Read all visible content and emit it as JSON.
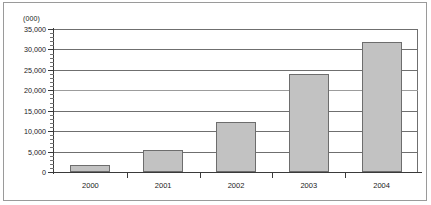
{
  "chart_data": {
    "type": "bar",
    "title": "",
    "subtitle": "",
    "unit_label": "(000)",
    "xlabel": "",
    "ylabel": "",
    "categories": [
      "2000",
      "2001",
      "2002",
      "2003",
      "2004"
    ],
    "values": [
      1700,
      5300,
      12300,
      24100,
      31800
    ],
    "series": [
      {
        "name": "",
        "values": [
          1700,
          5300,
          12300,
          24100,
          31800
        ]
      }
    ],
    "ylim": [
      0,
      35000
    ],
    "ytick_labels": [
      "0",
      "5,000",
      "10,000",
      "15,000",
      "20,000",
      "25,000",
      "30,000",
      "35,000"
    ],
    "ytick_values": [
      0,
      5000,
      10000,
      15000,
      20000,
      25000,
      30000,
      35000
    ],
    "minor_tick_interval": 1000,
    "grid": true,
    "grid_axis": "y",
    "legend": false,
    "legend_position": "none",
    "bar_color": "#c2c2c2",
    "bar_border_color": "#6d6d6d",
    "gridline_color": "#6f6f6f",
    "axis_color": "#3a3a3a",
    "frame_color": "#9a9a9a",
    "background_color": "#ffffff",
    "annotations": []
  }
}
